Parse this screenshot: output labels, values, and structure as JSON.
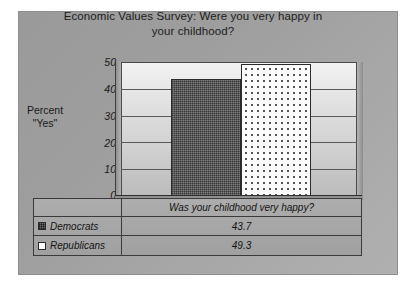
{
  "chart_data": {
    "type": "bar",
    "title": "Economic Values Survey: Were you very happy in your childhood?",
    "xlabel": "Was your childhood very happy?",
    "ylabel": "Percent \"Yes\"",
    "categories": [
      "Was your childhood very happy?"
    ],
    "series": [
      {
        "name": "Democrats",
        "values": [
          43.7
        ],
        "swatch": "dark-checker"
      },
      {
        "name": "Republicans",
        "values": [
          49.3
        ],
        "swatch": "white-dotted"
      }
    ],
    "ylim": [
      0,
      50
    ],
    "yticks": [
      50,
      40,
      30,
      20,
      10,
      0
    ],
    "ytick_labels": [
      "50",
      "40",
      "30",
      "20",
      "10",
      "0"
    ],
    "grid": true,
    "legend_position": "bottom-table",
    "value_labels": [
      "43.7",
      "49.3"
    ],
    "colors": {
      "plate_background": "#9e9e9e",
      "plot_background": "#dadada",
      "democrats_bar": "#7d7d7d",
      "republicans_bar": "#fbfbfb",
      "axis_line": "#3d3d3d",
      "text": "#1a1a1a"
    }
  },
  "title": {
    "line1": "Economic Values Survey: Were you very happy in",
    "line2": "your childhood?"
  },
  "axis": {
    "y_label_line1": "Percent",
    "y_label_line2": "\"Yes\"",
    "ticks": [
      "50",
      "40",
      "30",
      "20",
      "10",
      "0"
    ]
  },
  "table": {
    "x_category": "Was your childhood very happy?",
    "rows": [
      {
        "label": "Democrats",
        "value": "43.7"
      },
      {
        "label": "Republicans",
        "value": "49.3"
      }
    ]
  }
}
